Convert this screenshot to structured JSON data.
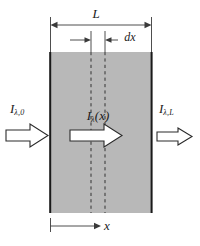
{
  "figure": {
    "colors": {
      "slab_fill": "#b8b8b8",
      "slab_edge": "#1a1a1a",
      "line": "#3a3a3a",
      "arrow_fill": "#ffffff",
      "arrow_edge": "#2b2b2b",
      "dashed": "#333333",
      "background": "#ffffff"
    },
    "geometry": {
      "slab_left": 50,
      "slab_right": 152,
      "slab_top": 52,
      "slab_bottom": 213,
      "dash_x1": 91,
      "dash_x2": 105
    },
    "labels": {
      "length": {
        "base": "L",
        "sub": ""
      },
      "thickness": {
        "base": "dx",
        "sub": ""
      },
      "incident_intensity": {
        "base": "I",
        "sub": "λ,0"
      },
      "local_intensity": {
        "base": "I",
        "sub": "λ",
        "arg": "(x)"
      },
      "exit_intensity": {
        "base": "I",
        "sub": "λ,L"
      },
      "position": {
        "base": "x",
        "sub": ""
      }
    },
    "elements": {
      "slab": "absorbing-medium-slab",
      "top_dimension": "length-dimension-L",
      "dx_dimension": "differential-thickness-dx",
      "bottom_dimension": "position-dimension-x",
      "incident_arrow": "incident-beam-arrow",
      "internal_arrow": "internal-beam-arrow",
      "exit_arrow": "transmitted-beam-arrow",
      "dashed_left": "dashed-slice-boundary-left",
      "dashed_right": "dashed-slice-boundary-right"
    }
  }
}
